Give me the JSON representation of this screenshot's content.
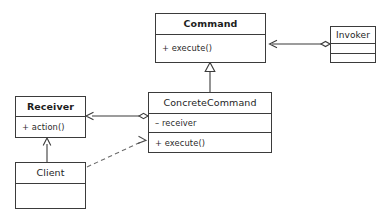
{
  "diagram": {
    "stroke_color": "#3b3b3b",
    "text_color": "#1d1d1d",
    "background": "#ffffff"
  },
  "classes": {
    "command": {
      "name": "Command",
      "members": [
        "+ execute()"
      ]
    },
    "invoker": {
      "name": "Invoker",
      "members": []
    },
    "concrete_command": {
      "name": "ConcreteCommand",
      "attributes": [
        "– receiver"
      ],
      "operations": [
        "+ execute()"
      ]
    },
    "receiver": {
      "name": "Receiver",
      "members": [
        "+ action()"
      ]
    },
    "client": {
      "name": "Client",
      "members": []
    }
  },
  "relations": [
    {
      "id": "invoker-command",
      "type": "aggregation",
      "from": "Invoker",
      "to": "Command",
      "source_decoration": "hollow-diamond",
      "target_decoration": "open-arrow",
      "line": "solid"
    },
    {
      "id": "concretecommand-command",
      "type": "generalization",
      "from": "ConcreteCommand",
      "to": "Command",
      "source_decoration": "none",
      "target_decoration": "hollow-triangle",
      "line": "solid"
    },
    {
      "id": "concretecommand-receiver",
      "type": "aggregation",
      "from": "ConcreteCommand",
      "to": "Receiver",
      "source_decoration": "hollow-diamond",
      "target_decoration": "open-arrow",
      "line": "solid"
    },
    {
      "id": "client-receiver",
      "type": "association",
      "from": "Client",
      "to": "Receiver",
      "source_decoration": "none",
      "target_decoration": "open-arrow",
      "line": "solid"
    },
    {
      "id": "client-concretecommand",
      "type": "dependency",
      "from": "Client",
      "to": "ConcreteCommand",
      "source_decoration": "none",
      "target_decoration": "open-arrow",
      "line": "dashed"
    }
  ]
}
